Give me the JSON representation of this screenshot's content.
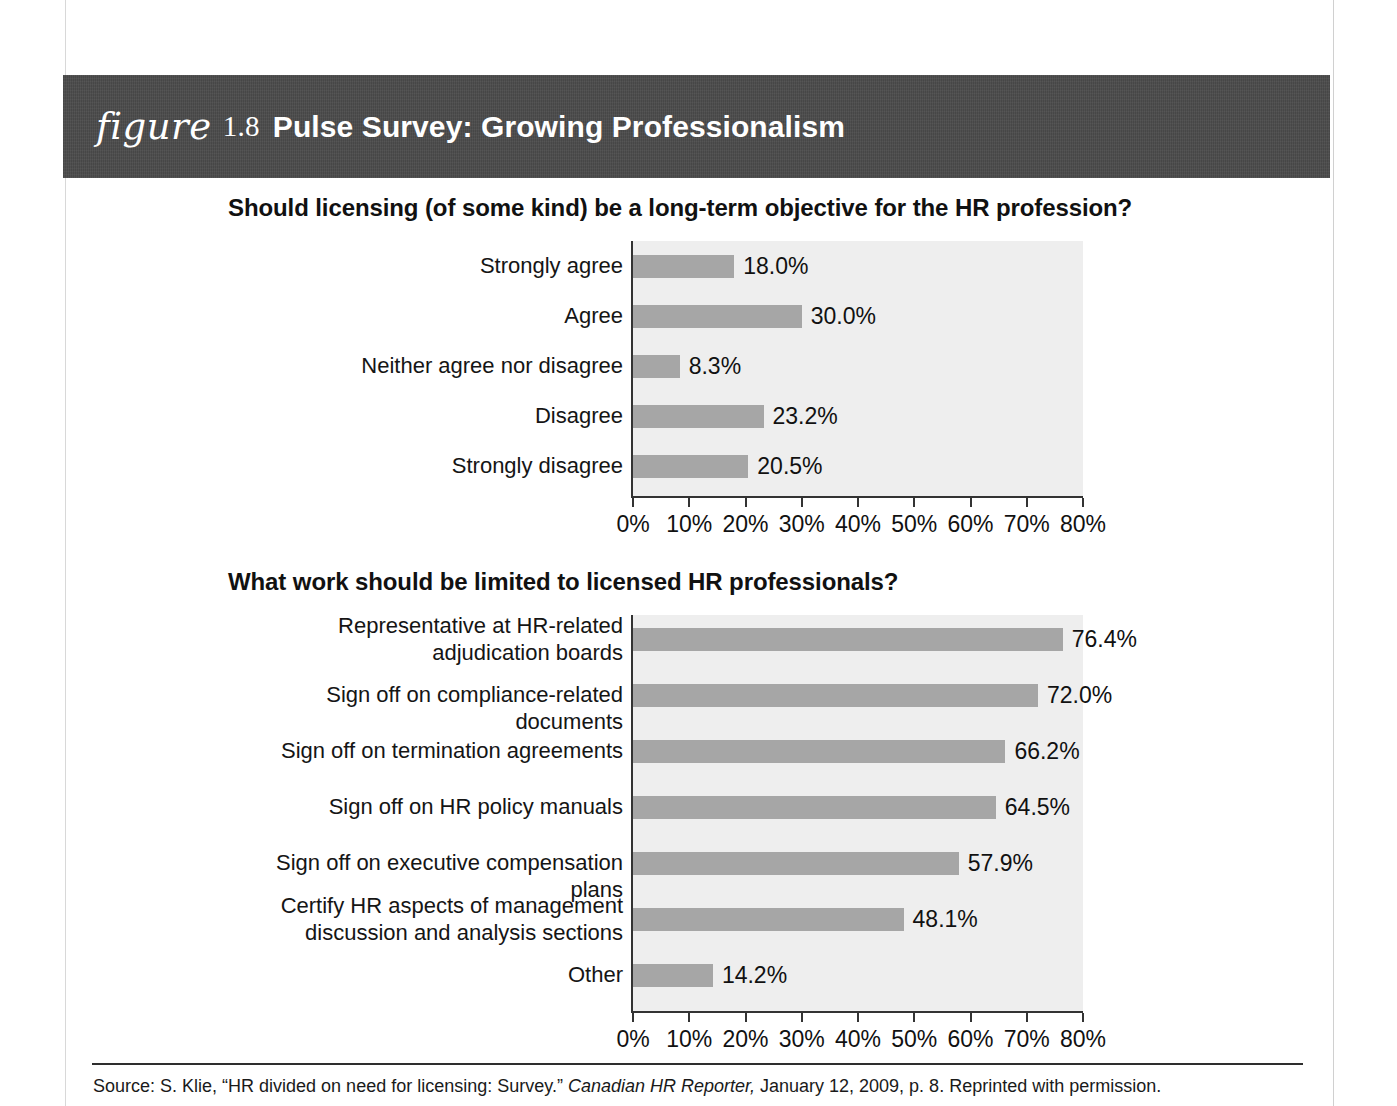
{
  "figure": {
    "word": "figure",
    "number": "1.8",
    "title": "Pulse Survey: Growing Professionalism"
  },
  "source": {
    "prefix": "Source: S. Klie, “HR divided on need for licensing: Survey.” ",
    "italic": "Canadian HR Reporter,",
    "suffix": " January 12, 2009, p. 8. Reprinted with permission."
  },
  "colors": {
    "band": "#4a4a4a",
    "bar": "#a6a6a6",
    "plot_background": "#eeeeee",
    "axis": "#333333",
    "text": "#111111"
  },
  "chart_data": [
    {
      "type": "bar",
      "orientation": "horizontal",
      "title": "Should licensing (of some kind) be a long-term objective for the HR profession?",
      "xlabel": "",
      "ylabel": "",
      "xlim": [
        0,
        80
      ],
      "grid": false,
      "legend": "none",
      "tick_labels": [
        "0%",
        "10%",
        "20%",
        "30%",
        "40%",
        "50%",
        "60%",
        "70%",
        "80%"
      ],
      "tick_values": [
        0,
        10,
        20,
        30,
        40,
        50,
        60,
        70,
        80
      ],
      "categories": [
        "Strongly agree",
        "Agree",
        "Neither agree nor disagree",
        "Disagree",
        "Strongly disagree"
      ],
      "values": [
        18.0,
        30.0,
        8.3,
        23.2,
        20.5
      ],
      "data_labels": [
        "18.0%",
        "30.0%",
        "8.3%",
        "23.2%",
        "20.5%"
      ]
    },
    {
      "type": "bar",
      "orientation": "horizontal",
      "title": "What work should be limited to licensed HR professionals?",
      "xlabel": "",
      "ylabel": "",
      "xlim": [
        0,
        80
      ],
      "grid": false,
      "legend": "none",
      "tick_labels": [
        "0%",
        "10%",
        "20%",
        "30%",
        "40%",
        "50%",
        "60%",
        "70%",
        "80%"
      ],
      "tick_values": [
        0,
        10,
        20,
        30,
        40,
        50,
        60,
        70,
        80
      ],
      "categories": [
        "Representative at HR-related\nadjudication boards",
        "Sign off on compliance-related documents",
        "Sign off on termination agreements",
        "Sign off on HR policy manuals",
        "Sign off on executive compensation plans",
        "Certify HR aspects of management\ndiscussion and analysis sections",
        "Other"
      ],
      "values": [
        76.4,
        72.0,
        66.2,
        64.5,
        57.9,
        48.1,
        14.2
      ],
      "data_labels": [
        "76.4%",
        "72.0%",
        "66.2%",
        "64.5%",
        "57.9%",
        "48.1%",
        "14.2%"
      ]
    }
  ]
}
